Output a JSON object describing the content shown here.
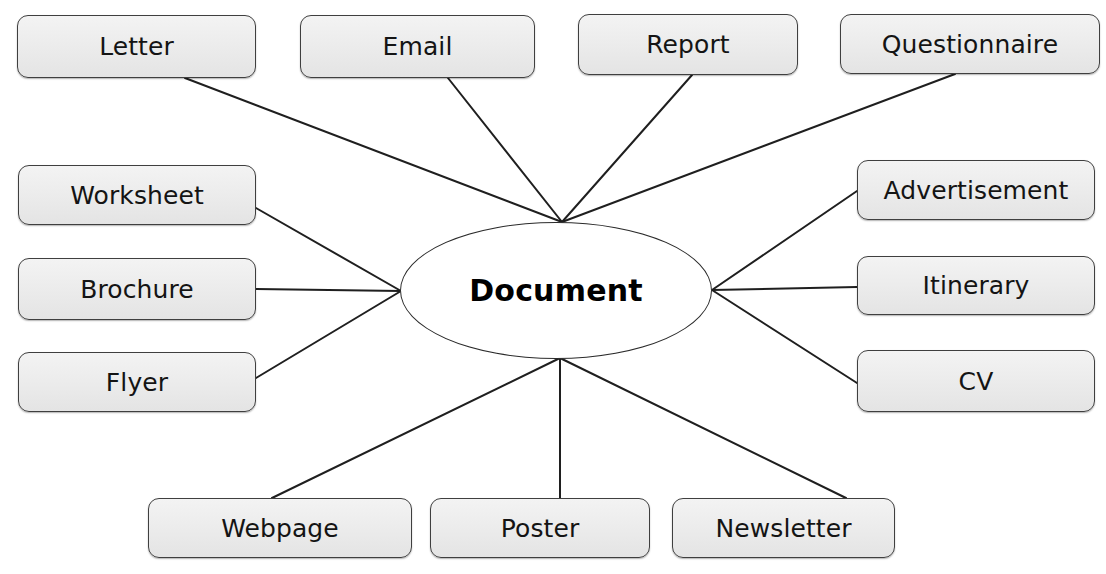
{
  "diagram": {
    "type": "concept-map",
    "canvas": {
      "width": 1106,
      "height": 574
    },
    "hub": {
      "label": "Document",
      "shape": "ellipse",
      "x": 400,
      "y": 222,
      "w": 312,
      "h": 137,
      "fill": "#ffffff",
      "stroke": "#2b2b2b"
    },
    "style": {
      "node_fill_top": "#f3f3f3",
      "node_fill_bottom": "#e4e4e4",
      "node_stroke": "#3f3f3f",
      "connector_stroke": "#1f1f1f",
      "connector_width": 2,
      "background": "#ffffff"
    },
    "anchors": {
      "top": {
        "x": 562,
        "y": 222
      },
      "left": {
        "x": 401,
        "y": 291
      },
      "right": {
        "x": 712,
        "y": 290
      },
      "bottom": {
        "x": 560,
        "y": 358
      }
    },
    "top_crop_text": {
      "left": "",
      "right": ""
    },
    "nodes": [
      {
        "id": "letter",
        "label": "Letter",
        "group": "top",
        "x": 17,
        "y": 15,
        "w": 239,
        "h": 63,
        "anchor": "top",
        "link_x": 185,
        "link_y": 78
      },
      {
        "id": "email",
        "label": "Email",
        "group": "top",
        "x": 300,
        "y": 15,
        "w": 235,
        "h": 63,
        "anchor": "top",
        "link_x": 448,
        "link_y": 78
      },
      {
        "id": "report",
        "label": "Report",
        "group": "top",
        "x": 578,
        "y": 14,
        "w": 220,
        "h": 61,
        "anchor": "top",
        "link_x": 692,
        "link_y": 75
      },
      {
        "id": "questionnaire",
        "label": "Questionnaire",
        "group": "top",
        "x": 840,
        "y": 14,
        "w": 260,
        "h": 60,
        "anchor": "top",
        "link_x": 955,
        "link_y": 74
      },
      {
        "id": "worksheet",
        "label": "Worksheet",
        "group": "left",
        "x": 18,
        "y": 165,
        "w": 238,
        "h": 60,
        "anchor": "left",
        "link_x": 256,
        "link_y": 208
      },
      {
        "id": "brochure",
        "label": "Brochure",
        "group": "left",
        "x": 18,
        "y": 258,
        "w": 238,
        "h": 62,
        "anchor": "left",
        "link_x": 256,
        "link_y": 289
      },
      {
        "id": "flyer",
        "label": "Flyer",
        "group": "left",
        "x": 18,
        "y": 352,
        "w": 238,
        "h": 60,
        "anchor": "left",
        "link_x": 256,
        "link_y": 378
      },
      {
        "id": "advertisement",
        "label": "Advertisement",
        "group": "right",
        "x": 857,
        "y": 160,
        "w": 238,
        "h": 60,
        "anchor": "right",
        "link_x": 857,
        "link_y": 191
      },
      {
        "id": "itinerary",
        "label": "Itinerary",
        "group": "right",
        "x": 857,
        "y": 256,
        "w": 238,
        "h": 59,
        "anchor": "right",
        "link_x": 857,
        "link_y": 287
      },
      {
        "id": "cv",
        "label": "CV",
        "group": "right",
        "x": 857,
        "y": 350,
        "w": 238,
        "h": 62,
        "anchor": "right",
        "link_x": 857,
        "link_y": 383
      },
      {
        "id": "webpage",
        "label": "Webpage",
        "group": "bottom",
        "x": 148,
        "y": 498,
        "w": 264,
        "h": 60,
        "anchor": "bottom",
        "link_x": 272,
        "link_y": 498
      },
      {
        "id": "poster",
        "label": "Poster",
        "group": "bottom",
        "x": 430,
        "y": 498,
        "w": 220,
        "h": 60,
        "anchor": "bottom",
        "link_x": 560,
        "link_y": 498
      },
      {
        "id": "newsletter",
        "label": "Newsletter",
        "group": "bottom",
        "x": 672,
        "y": 498,
        "w": 223,
        "h": 60,
        "anchor": "bottom",
        "link_x": 846,
        "link_y": 498
      }
    ]
  }
}
